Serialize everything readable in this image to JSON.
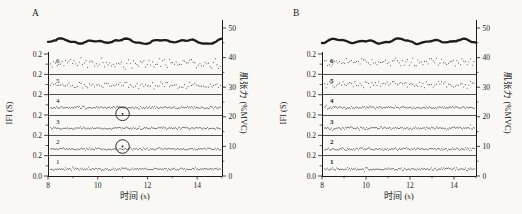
{
  "figure": {
    "background": "#f9f8f5",
    "ink": "#1c1c1c"
  },
  "chart_data": [
    {
      "type": "line",
      "panel_label": "A",
      "title": "",
      "xlabel": "时间 (s)",
      "ylabel_left": "IFI (S)",
      "ylabel_right": "肌张力 (%MVC)",
      "x_range_s": [
        8,
        15
      ],
      "x_tick_values": [
        8,
        10,
        12,
        14
      ],
      "x_tick_labels": [
        "8",
        "10",
        "12",
        "14"
      ],
      "x_minor_ticks": [
        9,
        11,
        13,
        15
      ],
      "left_axis": {
        "tick_labels": [
          "0.2",
          "0.2",
          "0.2",
          "0.2",
          "0.2",
          "0.2",
          "0.0"
        ],
        "units_per_band_s": 0.2
      },
      "right_axis": {
        "range": [
          0,
          50
        ],
        "tick_values": [
          0,
          10,
          20,
          30,
          40,
          50
        ],
        "tick_labels": [
          "0",
          "10",
          "20",
          "30",
          "40",
          "50"
        ]
      },
      "tension_trace": {
        "name": "muscle-tension",
        "mean_pct_mvc": 45.5,
        "wiggle_pct": 1.0
      },
      "bold_band_labels": false,
      "bands": [
        {
          "label": "6",
          "mean_ifi_s": 0.105,
          "jitter_ifi_s": 0.045,
          "style": "scatter"
        },
        {
          "label": "5",
          "mean_ifi_s": 0.09,
          "jitter_ifi_s": 0.028,
          "style": "scatter"
        },
        {
          "label": "4",
          "mean_ifi_s": 0.072,
          "jitter_ifi_s": 0.011,
          "style": "dense"
        },
        {
          "label": "3",
          "mean_ifi_s": 0.07,
          "jitter_ifi_s": 0.011,
          "style": "dense"
        },
        {
          "label": "2",
          "mean_ifi_s": 0.065,
          "jitter_ifi_s": 0.011,
          "style": "dense"
        },
        {
          "label": "1",
          "mean_ifi_s": 0.068,
          "jitter_ifi_s": 0.011,
          "style": "dense"
        }
      ],
      "annotations": [
        {
          "type": "circle",
          "x_s": 11.0,
          "band_label": "4",
          "ifi_s": 0.012
        },
        {
          "type": "circle",
          "x_s": 11.0,
          "band_label": "2",
          "ifi_s": 0.09
        }
      ]
    },
    {
      "type": "line",
      "panel_label": "B",
      "title": "",
      "xlabel": "时间 (s)",
      "ylabel_left": "IFI (S)",
      "ylabel_right": "肌张力 (%MVC)",
      "x_range_s": [
        8,
        15
      ],
      "x_tick_values": [
        8,
        10,
        12,
        14
      ],
      "x_tick_labels": [
        "8",
        "10",
        "12",
        "14"
      ],
      "x_minor_ticks": [
        9,
        11,
        13,
        15
      ],
      "left_axis": {
        "tick_labels": [
          "0.2",
          "0.2",
          "0.2",
          "0.2",
          "0.2",
          "0.2",
          "0.0"
        ],
        "units_per_band_s": 0.2
      },
      "right_axis": {
        "range": [
          0,
          50
        ],
        "tick_values": [
          0,
          10,
          20,
          30,
          40,
          50
        ],
        "tick_labels": [
          "0",
          "10",
          "20",
          "30",
          "40",
          "50"
        ]
      },
      "tension_trace": {
        "name": "muscle-tension",
        "mean_pct_mvc": 45.5,
        "wiggle_pct": 1.0
      },
      "bold_band_labels": true,
      "bands": [
        {
          "label": "6",
          "mean_ifi_s": 0.12,
          "jitter_ifi_s": 0.032,
          "style": "scatter"
        },
        {
          "label": "5",
          "mean_ifi_s": 0.1,
          "jitter_ifi_s": 0.03,
          "style": "scatter"
        },
        {
          "label": "4",
          "mean_ifi_s": 0.072,
          "jitter_ifi_s": 0.011,
          "style": "dense"
        },
        {
          "label": "3",
          "mean_ifi_s": 0.07,
          "jitter_ifi_s": 0.011,
          "style": "dense"
        },
        {
          "label": "2",
          "mean_ifi_s": 0.065,
          "jitter_ifi_s": 0.011,
          "style": "dense"
        },
        {
          "label": "1",
          "mean_ifi_s": 0.068,
          "jitter_ifi_s": 0.011,
          "style": "dense"
        }
      ],
      "annotations": []
    }
  ]
}
